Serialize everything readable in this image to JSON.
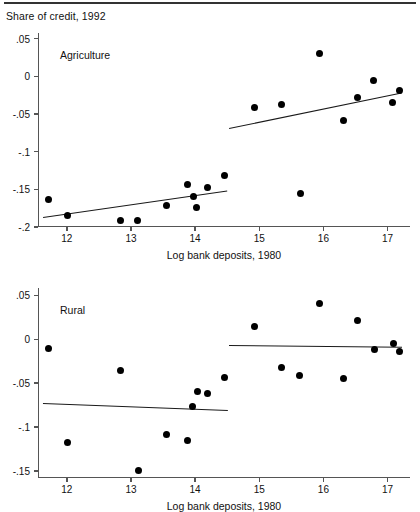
{
  "figure": {
    "caption": "Share of credit, 1992",
    "width": 420,
    "height": 512
  },
  "chart_data": [
    {
      "type": "scatter",
      "title": "Agriculture",
      "xlabel": "Log bank deposits, 1980",
      "ylabel": "Share of credit, 1992",
      "xlim": [
        11.55,
        17.35
      ],
      "ylim": [
        -0.2,
        0.0575
      ],
      "xticks": [
        12,
        13,
        14,
        15,
        16,
        17
      ],
      "xticklabels": [
        "12",
        "13",
        "14",
        "15",
        "16",
        "17"
      ],
      "yticks": [
        0.05,
        0,
        -0.05,
        -0.1,
        -0.15,
        -0.2
      ],
      "yticklabels": [
        ".05",
        "0",
        "-.05",
        "-.1",
        "-.15",
        "-.2"
      ],
      "grid": false,
      "legend": "none",
      "points": [
        {
          "x": 11.72,
          "y": -0.163
        },
        {
          "x": 12.01,
          "y": -0.185
        },
        {
          "x": 12.83,
          "y": -0.191
        },
        {
          "x": 13.1,
          "y": -0.192
        },
        {
          "x": 13.56,
          "y": -0.171
        },
        {
          "x": 13.88,
          "y": -0.144
        },
        {
          "x": 13.97,
          "y": -0.16
        },
        {
          "x": 14.02,
          "y": -0.174
        },
        {
          "x": 14.19,
          "y": -0.148
        },
        {
          "x": 14.46,
          "y": -0.131
        },
        {
          "x": 14.93,
          "y": -0.042
        },
        {
          "x": 15.35,
          "y": -0.038
        },
        {
          "x": 15.64,
          "y": -0.155
        },
        {
          "x": 15.94,
          "y": 0.03
        },
        {
          "x": 16.31,
          "y": -0.058
        },
        {
          "x": 16.53,
          "y": -0.028
        },
        {
          "x": 16.78,
          "y": -0.006
        },
        {
          "x": 17.08,
          "y": -0.035
        },
        {
          "x": 17.19,
          "y": -0.019
        }
      ],
      "fit_lines": [
        {
          "name": "left-segment-fit",
          "x0": 11.63,
          "y0": -0.187,
          "x1": 14.5,
          "y1": -0.152
        },
        {
          "name": "right-segment-fit",
          "x0": 14.53,
          "y0": -0.068,
          "x1": 17.22,
          "y1": -0.021
        }
      ]
    },
    {
      "type": "scatter",
      "title": "Rural",
      "xlabel": "Log bank deposits, 1980",
      "ylabel": "Share of credit, 1992",
      "xlim": [
        11.55,
        17.35
      ],
      "ylim": [
        -0.158,
        0.0585
      ],
      "xticks": [
        12,
        13,
        14,
        15,
        16,
        17
      ],
      "xticklabels": [
        "12",
        "13",
        "14",
        "15",
        "16",
        "17"
      ],
      "yticks": [
        0.05,
        0,
        -0.05,
        -0.1,
        -0.15
      ],
      "yticklabels": [
        ".05",
        "0",
        "-.05",
        "-.1",
        "-.15"
      ],
      "grid": false,
      "legend": "none",
      "points": [
        {
          "x": 11.72,
          "y": -0.011
        },
        {
          "x": 12.01,
          "y": -0.117
        },
        {
          "x": 12.83,
          "y": -0.035
        },
        {
          "x": 13.11,
          "y": -0.149
        },
        {
          "x": 13.56,
          "y": -0.108
        },
        {
          "x": 13.88,
          "y": -0.115
        },
        {
          "x": 13.96,
          "y": -0.077
        },
        {
          "x": 14.03,
          "y": -0.06
        },
        {
          "x": 14.19,
          "y": -0.062
        },
        {
          "x": 14.46,
          "y": -0.043
        },
        {
          "x": 14.93,
          "y": 0.015
        },
        {
          "x": 15.35,
          "y": -0.032
        },
        {
          "x": 15.63,
          "y": -0.041
        },
        {
          "x": 15.94,
          "y": 0.041
        },
        {
          "x": 16.31,
          "y": -0.045
        },
        {
          "x": 16.53,
          "y": 0.022
        },
        {
          "x": 16.8,
          "y": -0.012
        },
        {
          "x": 17.09,
          "y": -0.005
        },
        {
          "x": 17.19,
          "y": -0.014
        }
      ],
      "fit_lines": [
        {
          "name": "left-segment-fit",
          "x0": 11.63,
          "y0": -0.073,
          "x1": 14.51,
          "y1": -0.081
        },
        {
          "name": "right-segment-fit",
          "x0": 14.53,
          "y0": -0.006,
          "x1": 17.22,
          "y1": -0.008
        }
      ]
    }
  ]
}
